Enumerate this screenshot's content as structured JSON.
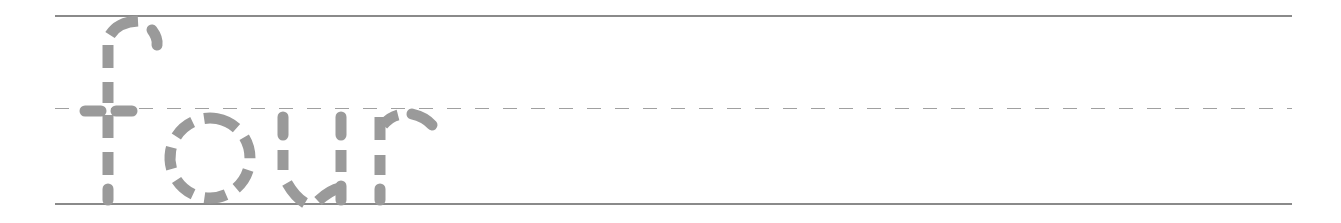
{
  "worksheet": {
    "word": "four",
    "letters": [
      "f",
      "o",
      "u",
      "r"
    ],
    "style": "dashed-tracing",
    "colors": {
      "letter": "#9a9a9a",
      "solid_rule": "#8a8a8a",
      "dashed_rule": "#a0a0a0",
      "background": "#ffffff"
    },
    "rules": {
      "top": "solid",
      "middle": "dashed",
      "bottom": "solid"
    }
  }
}
